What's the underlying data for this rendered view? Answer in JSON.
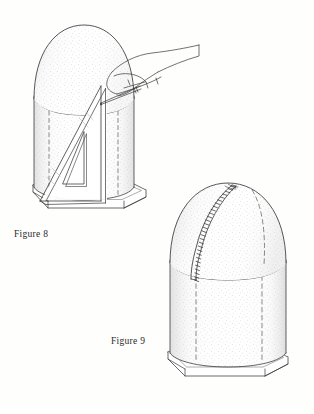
{
  "page": {
    "background_color": "#fefefd",
    "ink_color": "#3a3a3a",
    "width": 314,
    "height": 414,
    "medium": "pen-and-ink line drawing"
  },
  "figures": [
    {
      "id": "figure-8",
      "caption": "Figure 8",
      "caption_position": {
        "x": 14,
        "y": 229
      },
      "description": "Hand holding a pencil against a right-triangle set square resting on the octagonal base, marking a vertical line up the side of a dome-topped cylinder",
      "parts": [
        {
          "name": "dome",
          "style": "stippled",
          "outline": "solid"
        },
        {
          "name": "cylinder-body",
          "style": "stippled",
          "outline": "solid"
        },
        {
          "name": "hidden-edge-dashed-lines",
          "count": 2,
          "style": "dashed"
        },
        {
          "name": "marked-vertical-line",
          "style": "solid"
        },
        {
          "name": "set-square-triangle",
          "style": "solid",
          "detail": "triangular cut-out window"
        },
        {
          "name": "hand",
          "style": "contour-line"
        },
        {
          "name": "pencil",
          "style": "solid"
        },
        {
          "name": "octagonal-base-plinth",
          "style": "solid"
        }
      ]
    },
    {
      "id": "figure-9",
      "caption": "Figure 9",
      "caption_position": {
        "x": 111,
        "y": 336
      },
      "description": "Dome-topped cylinder on an octagonal base with a stitched seam running from the dome apex down to the cylinder rim",
      "parts": [
        {
          "name": "dome",
          "style": "stippled",
          "outline": "solid"
        },
        {
          "name": "cylinder-body",
          "style": "stippled",
          "outline": "solid"
        },
        {
          "name": "stitched-seam",
          "style": "solid-with-tick-stitches",
          "stitch_count": 28
        },
        {
          "name": "hidden-edge-dashed-lines",
          "count": 3,
          "style": "dashed"
        },
        {
          "name": "octagonal-base-plinth",
          "style": "solid"
        }
      ]
    }
  ]
}
